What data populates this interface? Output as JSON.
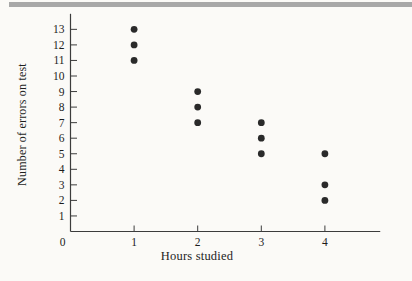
{
  "page": {
    "background_color": "#fbfaf7",
    "top_rule_color": "#a8a8a8"
  },
  "chart_data": {
    "type": "scatter",
    "title": "",
    "xlabel": "Hours studied",
    "ylabel": "Number of errors on test",
    "x_ticks": [
      0,
      1,
      2,
      3,
      4
    ],
    "y_ticks": [
      1,
      2,
      3,
      4,
      5,
      6,
      7,
      8,
      9,
      10,
      11,
      12,
      13
    ],
    "xlim": [
      0,
      4.87
    ],
    "ylim": [
      0,
      14
    ],
    "grid": false,
    "legend": null,
    "points": [
      {
        "x": 1,
        "y": 13
      },
      {
        "x": 1,
        "y": 12
      },
      {
        "x": 1,
        "y": 11
      },
      {
        "x": 2,
        "y": 9
      },
      {
        "x": 2,
        "y": 8
      },
      {
        "x": 2,
        "y": 7
      },
      {
        "x": 3,
        "y": 7
      },
      {
        "x": 3,
        "y": 6
      },
      {
        "x": 3,
        "y": 5
      },
      {
        "x": 4,
        "y": 5
      },
      {
        "x": 4,
        "y": 3
      },
      {
        "x": 4,
        "y": 2
      }
    ],
    "point_color": "#2a2a2a",
    "axis_color": "#3c3c3c"
  }
}
